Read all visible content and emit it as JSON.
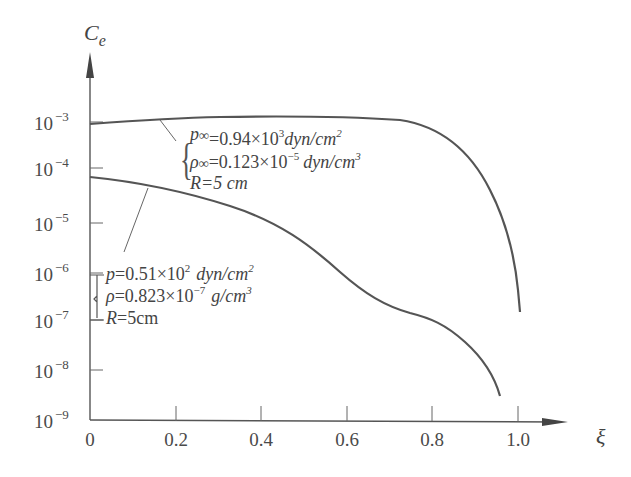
{
  "chart_data": {
    "type": "line",
    "title": "",
    "xlabel": "ξ",
    "ylabel": "C_e",
    "xscale": "linear",
    "yscale": "log",
    "xlim": [
      0,
      1.1
    ],
    "ylim": [
      1e-09,
      0.01
    ],
    "grid": false,
    "legend": "none (inline annotations with leader lines)",
    "x_ticks": [
      "0",
      "0.2",
      "0.4",
      "0.6",
      "0.8",
      "1.0"
    ],
    "y_ticks": [
      {
        "base": "10",
        "exp": "−3"
      },
      {
        "base": "10",
        "exp": "−4"
      },
      {
        "base": "10",
        "exp": "−5"
      },
      {
        "base": "10",
        "exp": "−6"
      },
      {
        "base": "10",
        "exp": "−7"
      },
      {
        "base": "10",
        "exp": "−8"
      },
      {
        "base": "10",
        "exp": "−9"
      }
    ],
    "series": [
      {
        "name": "p∞=0.94×10³ dyn/cm², ρ∞=0.123×10⁻⁵ dyn/cm³, R=5 cm",
        "x": [
          0.0,
          0.1,
          0.2,
          0.3,
          0.4,
          0.5,
          0.6,
          0.7,
          0.8,
          0.85,
          0.9,
          0.93,
          0.95
        ],
        "y": [
          0.00085,
          0.00095,
          0.0011,
          0.0012,
          0.00125,
          0.00125,
          0.0012,
          0.001,
          0.0006,
          0.00035,
          0.00012,
          2e-05,
          2e-07
        ]
      },
      {
        "name": "p=0.51×10² dyn/cm², ρ=0.823×10⁻⁷ g/cm³, R=5cm",
        "x": [
          0.0,
          0.1,
          0.2,
          0.3,
          0.4,
          0.5,
          0.6,
          0.7,
          0.75,
          0.8,
          0.85,
          0.9,
          0.91
        ],
        "y": [
          7e-05,
          5e-05,
          3.5e-05,
          1.5e-05,
          5e-06,
          1.2e-06,
          2e-07,
          8e-08,
          7e-08,
          4e-08,
          1.5e-08,
          4e-09,
          3e-09
        ]
      }
    ],
    "annotations": [
      {
        "target_series": 0,
        "lines": [
          {
            "sym": "p",
            "sub": "∞",
            "text": "=0.94×10",
            "sup": "3",
            "unit": "dyn/cm",
            "unit_sup": "2"
          },
          {
            "sym": "ρ",
            "sub": "∞",
            "text": "=0.123×10",
            "sup": "−5",
            "unit": "dyn/cm",
            "unit_sup": "3"
          },
          {
            "sym": "R",
            "sub": "",
            "text": "=5 cm",
            "sup": "",
            "unit": "",
            "unit_sup": ""
          }
        ]
      },
      {
        "target_series": 1,
        "lines": [
          {
            "sym": "p",
            "sub": "",
            "text": "=0.51×10",
            "sup": "2",
            "unit": "dyn/cm",
            "unit_sup": "2"
          },
          {
            "sym": "ρ",
            "sub": "",
            "text": "=0.823×10",
            "sup": "−7",
            "unit": "g/cm",
            "unit_sup": "3"
          },
          {
            "sym": "R",
            "sub": "",
            "text": "=5cm",
            "sup": "",
            "unit": "",
            "unit_sup": ""
          }
        ]
      }
    ]
  },
  "colors": {
    "ink": "#4a4a4a",
    "background": "#ffffff"
  }
}
